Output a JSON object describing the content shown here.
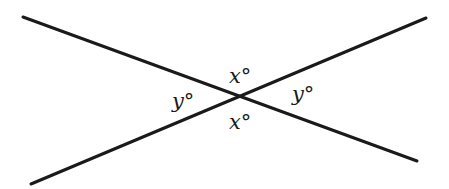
{
  "diagram": {
    "type": "intersecting-lines-vertical-angles",
    "lines": [
      {
        "id": "line-1",
        "x1": 23,
        "y1": 17,
        "x2": 417,
        "y2": 161
      },
      {
        "id": "line-2",
        "x1": 31,
        "y1": 184,
        "x2": 426,
        "y2": 18
      }
    ],
    "stroke_color": "#1a1a1a",
    "stroke_width": 3,
    "labels": {
      "top": "x°",
      "bottom": "x°",
      "left": "y°",
      "right": "y°"
    }
  }
}
